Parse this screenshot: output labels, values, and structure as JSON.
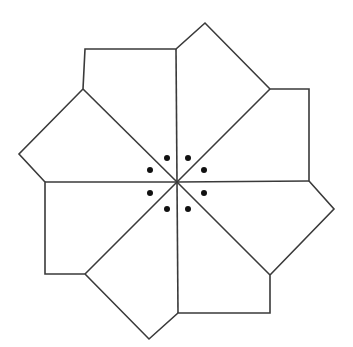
{
  "figure": {
    "stroke_color": "#3a3a3a",
    "dot_color": "#111111",
    "background": "#ffffff",
    "center": [
      177,
      182
    ],
    "outline": [
      [
        85,
        49
      ],
      [
        176,
        49
      ],
      [
        205,
        23
      ],
      [
        270,
        89
      ],
      [
        309,
        89
      ],
      [
        309,
        181
      ],
      [
        334,
        209
      ],
      [
        270,
        275
      ],
      [
        270,
        313
      ],
      [
        178,
        313
      ],
      [
        149,
        339
      ],
      [
        85,
        274
      ],
      [
        45,
        274
      ],
      [
        45,
        182
      ],
      [
        19,
        154
      ],
      [
        83,
        89
      ]
    ],
    "spokes": [
      [
        176,
        49
      ],
      [
        270,
        89
      ],
      [
        309,
        181
      ],
      [
        270,
        275
      ],
      [
        178,
        313
      ],
      [
        85,
        274
      ],
      [
        45,
        182
      ],
      [
        83,
        89
      ]
    ],
    "dots": [
      [
        167,
        158
      ],
      [
        188,
        158
      ],
      [
        150,
        170
      ],
      [
        204,
        170
      ],
      [
        150,
        193
      ],
      [
        204,
        193
      ],
      [
        167,
        209
      ],
      [
        188,
        209
      ]
    ]
  }
}
